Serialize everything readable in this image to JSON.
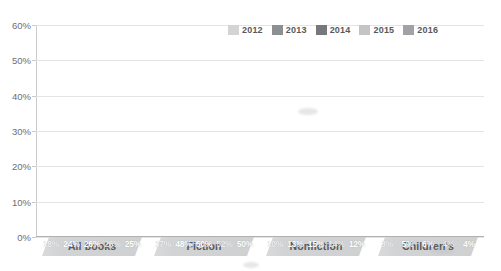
{
  "chart_data": {
    "type": "bar",
    "title": "",
    "xlabel": "",
    "ylabel": "",
    "ylim": [
      0,
      60
    ],
    "ytick_labels": [
      "0%",
      "10%",
      "20%",
      "30%",
      "40%",
      "50%",
      "60%"
    ],
    "ytick_values": [
      0,
      10,
      20,
      30,
      40,
      50,
      60
    ],
    "grid": true,
    "legend_position": "top-right",
    "categories": [
      "All books",
      "Fiction",
      "Nonfiction",
      "Children's"
    ],
    "series": [
      {
        "name": "2012",
        "color": "#d3d4d6",
        "values": [
          18,
          37,
          10,
          3
        ],
        "labels": [
          "18%",
          "37%",
          "10%",
          "3%"
        ]
      },
      {
        "name": "2013",
        "color": "#8d8f92",
        "values": [
          24,
          48,
          13,
          5
        ],
        "labels": [
          "24%",
          "48%",
          "13%",
          "5%"
        ]
      },
      {
        "name": "2014",
        "color": "#76787b",
        "values": [
          26,
          50,
          15,
          6
        ],
        "labels": [
          "26%",
          "50%",
          "15%",
          "6%"
        ]
      },
      {
        "name": "2015",
        "color": "#c3c4c6",
        "values": [
          26,
          52,
          14,
          4
        ],
        "labels": [
          "26%",
          "52%",
          "14%",
          "4%"
        ]
      },
      {
        "name": "2016",
        "color": "#a0a2a5",
        "values": [
          25,
          50,
          12,
          4
        ],
        "labels": [
          "25%",
          "50%",
          "12%",
          "4%"
        ]
      }
    ]
  },
  "legend": {
    "items": [
      {
        "label": "2012",
        "color": "#d3d4d6"
      },
      {
        "label": "2013",
        "color": "#8d8f92"
      },
      {
        "label": "2014",
        "color": "#76787b"
      },
      {
        "label": "2015",
        "color": "#c3c4c6"
      },
      {
        "label": "2016",
        "color": "#a0a2a5"
      }
    ]
  },
  "axis": {
    "y_labels": [
      "60%",
      "50%",
      "40%",
      "30%",
      "20%",
      "10%",
      "0%"
    ]
  }
}
